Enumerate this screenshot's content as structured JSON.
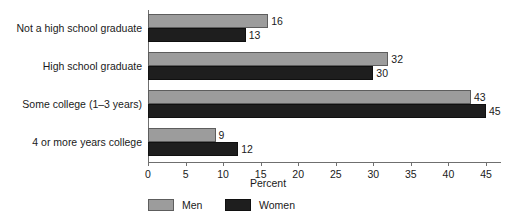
{
  "chart_data": {
    "type": "bar",
    "orientation": "horizontal",
    "title": "",
    "xlabel": "Percent",
    "ylabel": "",
    "xlim": [
      0,
      47
    ],
    "xticks": [
      0,
      5,
      10,
      15,
      20,
      25,
      30,
      35,
      40,
      45
    ],
    "grid": false,
    "legend_position": "bottom",
    "categories": [
      "Not a high school graduate",
      "High school graduate",
      "Some college (1–3 years)",
      "4 or more years college"
    ],
    "series": [
      {
        "name": "Men",
        "color": "#9c9c9c",
        "values": [
          16,
          32,
          43,
          9
        ]
      },
      {
        "name": "Women",
        "color": "#1e1e1e",
        "values": [
          13,
          30,
          45,
          12
        ]
      }
    ],
    "data_labels": {
      "Men": [
        "16",
        "32",
        "43",
        "9"
      ],
      "Women": [
        "13",
        "30",
        "45",
        "12"
      ]
    }
  },
  "legend": {
    "items": [
      {
        "label": "Men",
        "swatch": "men"
      },
      {
        "label": "Women",
        "swatch": "women"
      }
    ]
  },
  "axis": {
    "x_title": "Percent",
    "tick_labels": [
      "0",
      "5",
      "10",
      "15",
      "20",
      "25",
      "30",
      "35",
      "40",
      "45"
    ]
  },
  "colors": {
    "men": "#9c9c9c",
    "women": "#1e1e1e",
    "axis": "#6f6f6f",
    "text": "#1a1a1a",
    "background": "#ffffff"
  }
}
